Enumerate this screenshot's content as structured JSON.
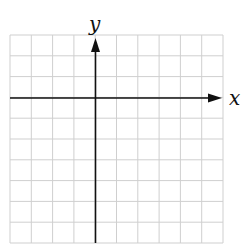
{
  "diagram": {
    "type": "coordinate-grid",
    "x_axis_label": "x",
    "y_axis_label": "y",
    "columns": 10,
    "rows": 10,
    "origin_column": 4,
    "origin_row": 3,
    "grid_color": "#cfcfcf",
    "axis_color": "#111111"
  }
}
